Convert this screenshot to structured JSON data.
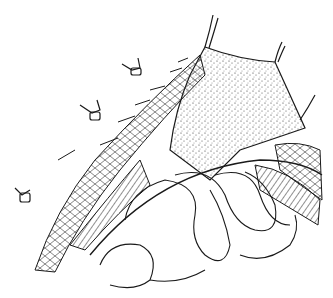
{
  "image": {
    "kind": "surgical line illustration",
    "description": "Abdominal wall layers retracted with sutures/clamps, stippled peritoneal flap, underlying coiled bowel loops",
    "colors": {
      "background": "#ffffff",
      "ink": "#1a1a1a",
      "stipple": "#333333"
    },
    "elements": [
      {
        "name": "stippled-flap",
        "label": "Stippled tissue flap"
      },
      {
        "name": "retractor-clamps",
        "label": "Retractor clamps",
        "count": 3
      },
      {
        "name": "suture-lines",
        "label": "Traction sutures",
        "count": 3
      },
      {
        "name": "muscle-layer",
        "label": "Muscle layer (cross-hatched)"
      },
      {
        "name": "fat-layer",
        "label": "Subcutaneous fat layer (cellular pattern)"
      },
      {
        "name": "bowel-loops",
        "label": "Bowel loops"
      }
    ]
  }
}
